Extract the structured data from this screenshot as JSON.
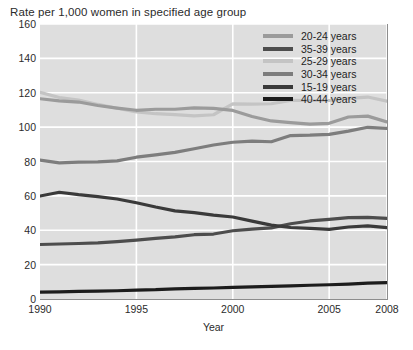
{
  "chart_data": {
    "type": "line",
    "title": "Rate per 1,000 women in specified age group",
    "xlabel": "Year",
    "ylabel": "",
    "xlim": [
      1990,
      2008
    ],
    "ylim": [
      0,
      160
    ],
    "grid": true,
    "legend_position": "top-right",
    "background": "#dedede",
    "gridline_color": "#ffffff",
    "x": [
      1990,
      1991,
      1992,
      1993,
      1994,
      1995,
      1996,
      1997,
      1998,
      1999,
      2000,
      2001,
      2002,
      2003,
      2004,
      2005,
      2006,
      2007,
      2008
    ],
    "xticks": [
      1990,
      1995,
      2000,
      2005,
      2008
    ],
    "xtick_labels": [
      "1990",
      "1995",
      "2000",
      "2005",
      "2008"
    ],
    "yticks": [
      0,
      20,
      40,
      60,
      80,
      100,
      120,
      140,
      160
    ],
    "ytick_labels": [
      "0",
      "20",
      "40",
      "60",
      "80",
      "100",
      "120",
      "140",
      "160"
    ],
    "series": [
      {
        "name": "20-24 years",
        "color": "#9b9b9b",
        "width": 3.2,
        "values": [
          116.5,
          115.3,
          114.6,
          112.6,
          111.1,
          109.8,
          110.4,
          110.4,
          111.2,
          110.9,
          109.7,
          106.2,
          103.6,
          102.6,
          101.7,
          102.2,
          105.9,
          106.4,
          103.0
        ]
      },
      {
        "name": "35-39 years",
        "color": "#4d4d4d",
        "width": 3.2,
        "values": [
          31.7,
          32.0,
          32.3,
          32.7,
          33.4,
          34.3,
          35.3,
          36.1,
          37.4,
          37.8,
          39.7,
          40.6,
          41.4,
          43.8,
          45.4,
          46.3,
          47.3,
          47.5,
          46.9
        ]
      },
      {
        "name": "25-29 years",
        "color": "#c4c4c4",
        "width": 3.2,
        "values": [
          120.2,
          117.2,
          115.7,
          113.2,
          111.0,
          108.8,
          107.8,
          107.3,
          106.5,
          107.2,
          113.5,
          113.4,
          113.6,
          115.6,
          115.5,
          115.5,
          116.7,
          117.5,
          115.1
        ]
      },
      {
        "name": "30-34 years",
        "color": "#7d7d7d",
        "width": 3.2,
        "values": [
          80.8,
          79.2,
          79.6,
          79.8,
          80.4,
          82.5,
          83.9,
          85.3,
          87.4,
          89.6,
          91.2,
          91.9,
          91.5,
          95.1,
          95.3,
          95.8,
          97.7,
          99.9,
          99.3
        ]
      },
      {
        "name": "15-19 years",
        "color": "#3a3a3a",
        "width": 3.2,
        "values": [
          59.9,
          62.1,
          60.7,
          59.6,
          58.2,
          56.0,
          53.5,
          51.3,
          50.3,
          48.8,
          47.7,
          45.3,
          43.0,
          41.6,
          41.1,
          40.5,
          41.9,
          42.5,
          41.5
        ]
      },
      {
        "name": "40-44 years",
        "color": "#1c1c1c",
        "width": 3.2,
        "values": [
          4.0,
          4.2,
          4.4,
          4.6,
          4.8,
          5.2,
          5.4,
          5.9,
          6.2,
          6.4,
          6.8,
          7.1,
          7.3,
          7.6,
          8.0,
          8.3,
          8.7,
          9.2,
          9.5
        ]
      }
    ],
    "legend_entries": [
      {
        "label": "20-24 years",
        "color": "#9b9b9b"
      },
      {
        "label": "35-39 years",
        "color": "#4d4d4d"
      },
      {
        "label": "25-29 years",
        "color": "#c4c4c4"
      },
      {
        "label": "30-34 years",
        "color": "#7d7d7d"
      },
      {
        "label": "15-19 years",
        "color": "#3a3a3a"
      },
      {
        "label": "40-44 years",
        "color": "#1c1c1c"
      }
    ]
  }
}
